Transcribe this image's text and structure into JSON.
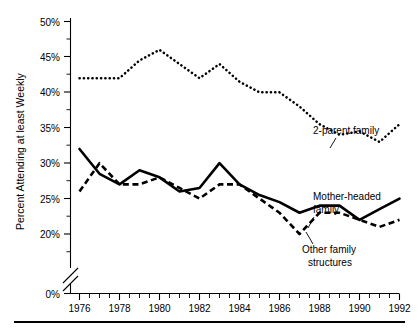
{
  "figure": {
    "name": "church-attendance-by-family-structure-chart"
  },
  "chart_data": {
    "type": "line",
    "title": "",
    "xlabel": "",
    "ylabel": "Percent Attending at least Weekly",
    "x": [
      1976,
      1977,
      1978,
      1979,
      1980,
      1981,
      1982,
      1983,
      1984,
      1985,
      1986,
      1987,
      1988,
      1989,
      1990,
      1991,
      1992
    ],
    "xlim": [
      1976,
      1992
    ],
    "ylim": [
      19,
      50
    ],
    "y_axis_break": true,
    "y_axis_break_label": "0%",
    "grid": false,
    "legend_position": "inline-annotations",
    "x_tick_labels": [
      "1976",
      "1978",
      "1980",
      "1982",
      "1984",
      "1986",
      "1988",
      "1990",
      "1992"
    ],
    "x_tick_values": [
      1976,
      1978,
      1980,
      1982,
      1984,
      1986,
      1988,
      1990,
      1992
    ],
    "x_minor_tick_values": [
      1977,
      1979,
      1981,
      1983,
      1985,
      1987,
      1989,
      1991
    ],
    "y_tick_labels": [
      "0%",
      "20%",
      "25%",
      "30%",
      "35%",
      "40%",
      "45%",
      "50%"
    ],
    "y_tick_values": [
      0,
      20,
      25,
      30,
      35,
      40,
      45,
      50
    ],
    "y_minor_tick_values": [
      22.5,
      27.5,
      32.5,
      37.5,
      42.5,
      47.5
    ],
    "series": [
      {
        "name": "2-parent family",
        "style": "dotted",
        "label": "2-parent family",
        "values": [
          42.0,
          42.0,
          42.0,
          44.5,
          46.0,
          44.0,
          42.0,
          44.0,
          41.5,
          40.0,
          40.0,
          38.0,
          35.5,
          34.0,
          34.5,
          33.0,
          35.5
        ]
      },
      {
        "name": "Mother-headed family",
        "style": "solid",
        "label": "Mother-headed family",
        "values": [
          32.0,
          28.5,
          27.0,
          29.0,
          28.0,
          26.0,
          26.5,
          30.0,
          27.0,
          25.5,
          24.5,
          23.0,
          24.0,
          24.0,
          22.0,
          23.5,
          25.0
        ]
      },
      {
        "name": "Other family structures",
        "style": "dashed",
        "label": "Other family structures",
        "values": [
          26.0,
          30.0,
          27.0,
          27.0,
          28.0,
          26.5,
          25.0,
          27.0,
          27.0,
          25.0,
          23.0,
          20.0,
          23.0,
          23.0,
          22.0,
          21.0,
          22.0
        ]
      }
    ],
    "annotations": [
      {
        "text": "2-parent family",
        "series": "2-parent family"
      },
      {
        "text": "Mother-headed",
        "series": "Mother-headed family"
      },
      {
        "text": "family",
        "series": "Mother-headed family"
      },
      {
        "text": "Other family",
        "series": "Other family structures"
      },
      {
        "text": "structures",
        "series": "Other family structures"
      }
    ]
  }
}
